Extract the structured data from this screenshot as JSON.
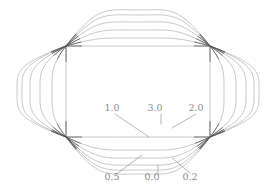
{
  "figure": {
    "title": "",
    "background_color": "#ffffff",
    "width": 276,
    "height": 191
  },
  "chart_data": {
    "type": "line",
    "title": "",
    "subtitle": "",
    "xlabel": "",
    "ylabel": "",
    "grid": false,
    "legend_position": "inline-annotations",
    "parameter_name": "",
    "node_points": [
      {
        "name": "upper-left-node",
        "x": 66,
        "y": 46
      },
      {
        "name": "upper-right-node",
        "x": 210,
        "y": 46
      },
      {
        "name": "lower-left-node",
        "x": 66,
        "y": 137
      },
      {
        "name": "lower-right-node",
        "x": 210,
        "y": 137
      }
    ],
    "series": [
      {
        "name": "0.0",
        "value": 0.0,
        "label": "0.0",
        "color": "#a8a8a8",
        "top_y": 46,
        "bottom_y": 137,
        "left_x": 66,
        "right_x": 210
      },
      {
        "name": "0.2",
        "value": 0.2,
        "label": "0.2",
        "color": "#a8a8a8",
        "top_y": 38,
        "bottom_y": 150,
        "left_x": 52,
        "right_x": 224
      },
      {
        "name": "0.5",
        "value": 0.5,
        "label": "0.5",
        "color": "#a8a8a8",
        "top_y": 30,
        "bottom_y": 158,
        "left_x": 40,
        "right_x": 236
      },
      {
        "name": "1.0",
        "value": 1.0,
        "label": "1.0",
        "color": "#a8a8a8",
        "top_y": 22,
        "bottom_y": 165,
        "left_x": 30,
        "right_x": 246
      },
      {
        "name": "2.0",
        "value": 2.0,
        "label": "2.0",
        "color": "#a8a8a8",
        "top_y": 15,
        "bottom_y": 170,
        "left_x": 22,
        "right_x": 254
      },
      {
        "name": "3.0",
        "value": 3.0,
        "label": "3.0",
        "color": "#a8a8a8",
        "top_y": 10,
        "bottom_y": 174,
        "left_x": 17,
        "right_x": 259
      }
    ],
    "annotations": [
      {
        "name": "label-1.0",
        "text": "1.0",
        "label_x": 112,
        "label_y": 111,
        "leader_from_x": 115,
        "leader_from_y": 114,
        "leader_to_x": 149,
        "leader_to_y": 137
      },
      {
        "name": "label-3.0",
        "text": "3.0",
        "label_x": 155,
        "label_y": 111,
        "leader_from_x": 161,
        "leader_from_y": 114,
        "leader_to_x": 161,
        "leader_to_y": 124
      },
      {
        "name": "label-2.0",
        "text": "2.0",
        "label_x": 196,
        "label_y": 111,
        "leader_from_x": 196,
        "leader_from_y": 114,
        "leader_to_x": 172,
        "leader_to_y": 128
      },
      {
        "name": "label-0.5",
        "text": "0.5",
        "label_x": 112,
        "label_y": 180,
        "leader_from_x": 118,
        "leader_from_y": 173,
        "leader_to_x": 142,
        "leader_to_y": 155
      },
      {
        "name": "label-0.0",
        "text": "0.0",
        "label_x": 152,
        "label_y": 180,
        "leader_from_x": 158,
        "leader_from_y": 173,
        "leader_to_x": 158,
        "leader_to_y": 165
      },
      {
        "name": "label-0.2",
        "text": "0.2",
        "label_x": 190,
        "label_y": 180,
        "leader_from_x": 190,
        "leader_from_y": 173,
        "leader_to_x": 172,
        "leader_to_y": 158
      }
    ],
    "colors": {
      "curve": "#a8a8a8",
      "curve_dark": "#555555",
      "leader": "#9a9a9a",
      "text": "#8a8a8a",
      "background": "#ffffff"
    }
  }
}
